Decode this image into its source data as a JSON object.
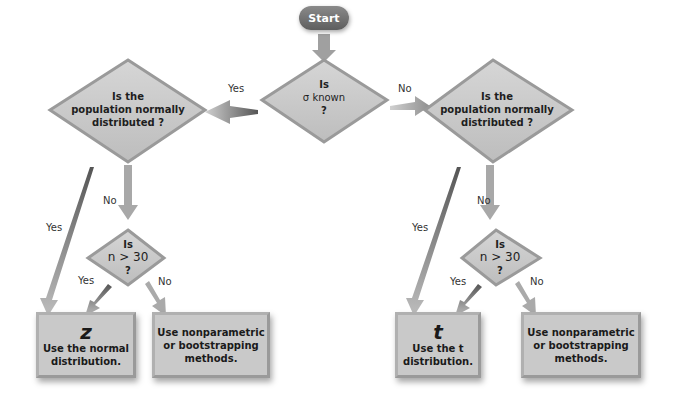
{
  "start": {
    "label": "Start"
  },
  "decision_sigma": {
    "line1": "Is",
    "line2": "σ known",
    "line3": "?"
  },
  "left_branch": {
    "edge_label": "Yes",
    "decision_normal": {
      "line1": "Is the",
      "line2": "population normally",
      "line3": "distributed ?"
    },
    "yes_label": "Yes",
    "no_label": "No",
    "decision_n": {
      "line1": "Is",
      "line2": "n > 30",
      "line3": "?"
    },
    "n_yes_label": "Yes",
    "n_no_label": "No",
    "result_normal": {
      "symbol": "z",
      "line1": "Use the normal",
      "line2": "distribution."
    },
    "result_nonparam": {
      "line1": "Use nonparametric",
      "line2": "or bootstrapping",
      "line3": "methods."
    }
  },
  "right_branch": {
    "edge_label": "No",
    "decision_normal": {
      "line1": "Is the",
      "line2": "population normally",
      "line3": "distributed ?"
    },
    "yes_label": "Yes",
    "no_label": "No",
    "decision_n": {
      "line1": "Is",
      "line2": "n > 30",
      "line3": "?"
    },
    "n_yes_label": "Yes",
    "n_no_label": "No",
    "result_t": {
      "symbol": "t",
      "line1": "Use the t",
      "line2": "distribution."
    },
    "result_nonparam": {
      "line1": "Use nonparametric",
      "line2": "or bootstrapping",
      "line3": "methods."
    }
  },
  "colors": {
    "node_fill": "#c9c9c9",
    "node_border": "#9a9a9a",
    "start_fill": "#6e6e6e",
    "arrow": "#a8a8a8"
  }
}
